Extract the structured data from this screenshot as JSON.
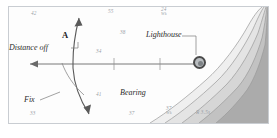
{
  "chart": {
    "background_color": "#fdfdfd",
    "frame_color": "#c9cdd2"
  },
  "annotations": [
    {
      "id": "distance-off",
      "label": "Distance off"
    },
    {
      "id": "fix",
      "label": "Fix"
    },
    {
      "id": "bearing",
      "label": "Bearing"
    },
    {
      "id": "lighthouse",
      "label": "Lighthouse"
    },
    {
      "id": "track-a",
      "label": "A"
    }
  ],
  "soundings": [
    {
      "id": "s-42",
      "value": "42",
      "qualifier": ""
    },
    {
      "id": "s-55",
      "value": "55",
      "qualifier": ""
    },
    {
      "id": "s-24",
      "value": "24",
      "qualifier": "Wk"
    },
    {
      "id": "s-38",
      "value": "38",
      "qualifier": ""
    },
    {
      "id": "s-34",
      "value": "34",
      "qualifier": ""
    },
    {
      "id": "s-41",
      "value": "41",
      "qualifier": ""
    },
    {
      "id": "s-33",
      "value": "33",
      "qualifier": ""
    },
    {
      "id": "s-37a",
      "value": "37",
      "qualifier": ""
    },
    {
      "id": "s-37b",
      "value": "37",
      "qualifier": "Wk"
    }
  ],
  "light_characteristic": {
    "id": "light-char",
    "label": "R 3.5s"
  },
  "depth_bands": {
    "colors": [
      "#efefef",
      "#e2e2e2",
      "#d2d2d2",
      "#bfbfbf",
      "#ababab"
    ],
    "count": 5
  },
  "lines": {
    "track_color": "#5a5a5a",
    "bearing_color": "#6a6a6a",
    "leader_color": "#7a7a7a"
  }
}
